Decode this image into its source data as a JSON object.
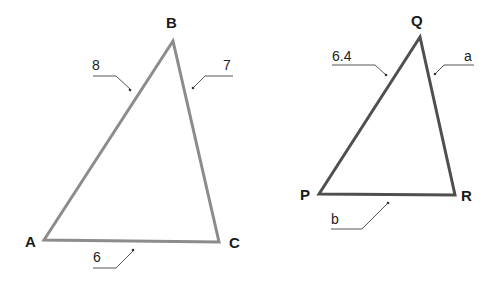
{
  "diagram": {
    "type": "similar-triangles",
    "triangles": [
      {
        "name": "ABC",
        "stroke_color": "#8c8c8c",
        "vertices": {
          "A": {
            "label": "A"
          },
          "B": {
            "label": "B"
          },
          "C": {
            "label": "C"
          }
        },
        "sides": {
          "AB": {
            "label": "8"
          },
          "BC": {
            "label": "7"
          },
          "AC": {
            "label": "6"
          }
        }
      },
      {
        "name": "PQR",
        "stroke_color": "#4f4f4f",
        "vertices": {
          "P": {
            "label": "P"
          },
          "Q": {
            "label": "Q"
          },
          "R": {
            "label": "R"
          }
        },
        "sides": {
          "PQ": {
            "label": "6.4"
          },
          "QR": {
            "label": "a"
          },
          "PR": {
            "label": "b"
          }
        }
      }
    ]
  }
}
